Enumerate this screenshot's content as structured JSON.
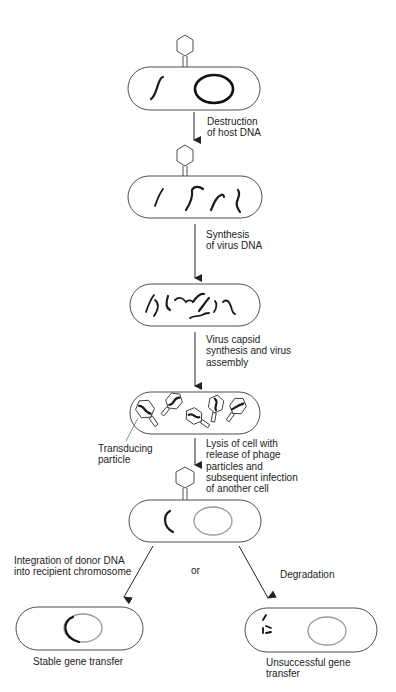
{
  "diagram": {
    "steps": [
      {
        "id": "infection",
        "label": ""
      },
      {
        "id": "destruction",
        "label": "Destruction\nof host DNA"
      },
      {
        "id": "synthesis",
        "label": "Synthesis\nof virus DNA"
      },
      {
        "id": "assembly",
        "label": "Virus capsid\nsynthesis and virus\nassembly"
      },
      {
        "id": "lysis",
        "label": "Lysis of cell with\nrelease of phage\nparticles and\nsubsequent infection\nof another cell"
      }
    ],
    "callouts": {
      "transducing_particle": "Transducing\nparticle"
    },
    "branches": {
      "left_label": "Integration of donor DNA\ninto recipient chromosome",
      "or_label": "or",
      "right_label": "Degradation",
      "left_outcome": "Stable gene transfer",
      "right_outcome": "Unsuccessful gene\ntransfer"
    },
    "colors": {
      "outline": "#3a3a3a",
      "dna": "#1a1a1a",
      "recipient_chromosome": "#9a9a9a",
      "text": "#222222",
      "background": "#ffffff"
    }
  }
}
